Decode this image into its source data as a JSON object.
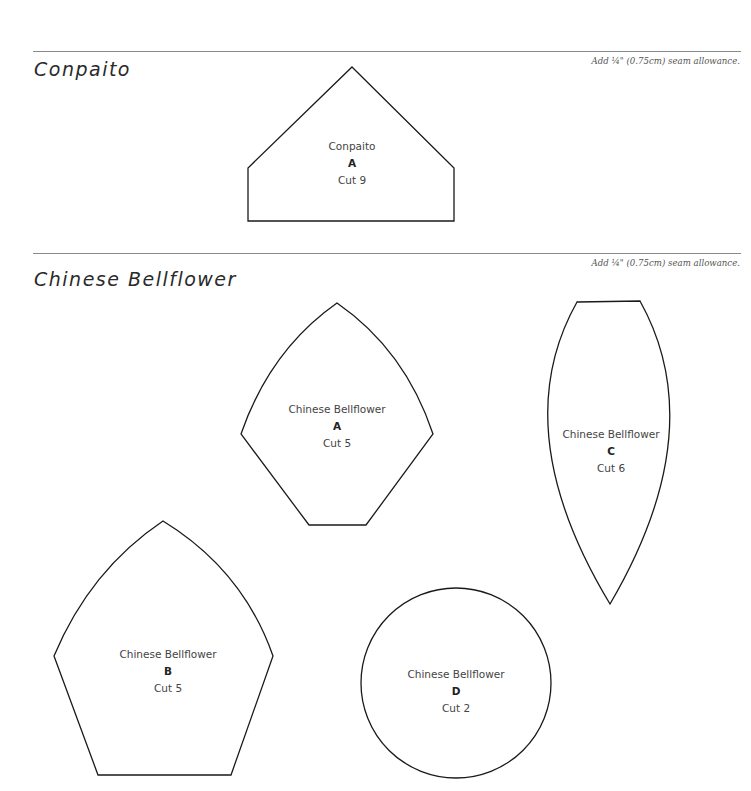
{
  "sections": [
    {
      "title": "Conpaito",
      "seam_note": "Add ¼\" (0.75cm) seam allowance.",
      "pieces": [
        {
          "name": "Conpaito",
          "letter": "A",
          "cut": "Cut 9",
          "shape": "pentagon-house"
        }
      ]
    },
    {
      "title": "Chinese Bellflower",
      "seam_note": "Add ¼\" (0.75cm) seam allowance.",
      "pieces": [
        {
          "name": "Chinese Bellflower",
          "letter": "A",
          "cut": "Cut 5",
          "shape": "curved-pentagon"
        },
        {
          "name": "Chinese Bellflower",
          "letter": "C",
          "cut": "Cut 6",
          "shape": "petal"
        },
        {
          "name": "Chinese Bellflower",
          "letter": "B",
          "cut": "Cut 5",
          "shape": "curved-pentagon"
        },
        {
          "name": "Chinese Bellflower",
          "letter": "D",
          "cut": "Cut 2",
          "shape": "circle"
        }
      ]
    }
  ],
  "colors": {
    "outline": "#1a1a1a",
    "divider": "#8a8a8a",
    "text": "#444444",
    "background": "#ffffff"
  }
}
